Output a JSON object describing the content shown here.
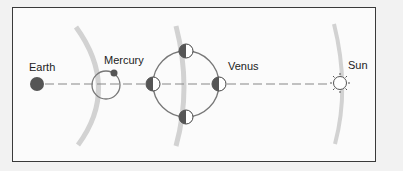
{
  "diagram": {
    "title": "",
    "bodies": [
      {
        "id": "earth",
        "label": "Earth"
      },
      {
        "id": "mercury",
        "label": "Mercury"
      },
      {
        "id": "venus",
        "label": "Venus"
      },
      {
        "id": "sun",
        "label": "Sun"
      }
    ],
    "colors": {
      "frame": "#3a3a3a",
      "planet_fill": "#555555",
      "orbit_line": "#777777",
      "sight_line": "#888888",
      "arc_band": "#cccccc",
      "background": "#fbfbfb"
    },
    "venus_phases_shown": 4
  }
}
